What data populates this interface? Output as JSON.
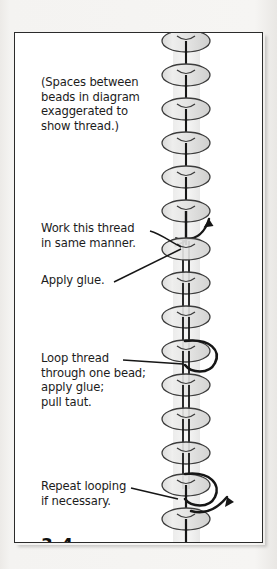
{
  "figure": {
    "number": "3–4",
    "frame_border_color": "#2b2b2b",
    "page_background": "#f3f2f0",
    "frame_background": "#ffffff"
  },
  "annotations": [
    {
      "id": "note",
      "name": "caption-spaces-note",
      "text": "(Spaces between\nbeads in diagram\nexaggerated to\nshow thread.)",
      "has_leader_line": false
    },
    {
      "id": "work",
      "name": "caption-work-thread",
      "text": "Work this thread\nin same manner.",
      "has_leader_line": true
    },
    {
      "id": "glue",
      "name": "caption-apply-glue",
      "text": "Apply glue.",
      "has_leader_line": true
    },
    {
      "id": "loop",
      "name": "caption-loop-thread",
      "text": "Loop thread\nthrough one bead;\napply glue;\npull taut.",
      "has_leader_line": true
    },
    {
      "id": "repeat",
      "name": "caption-repeat-looping",
      "text": "Repeat looping\nif necessary.",
      "has_leader_line": true
    }
  ],
  "diagram": {
    "type": "bead-strand-threading",
    "bead_count": 15,
    "bead_fill": "#e3e3e2",
    "bead_stroke": "#3c3c3c",
    "thread_color": "#161616",
    "column_center_x": 171,
    "bead_radius_x": 24,
    "bead_radius_y": 11,
    "bead_spacing_y": 34,
    "first_bead_y": 8,
    "arrows": [
      {
        "name": "arrow-upper-thread",
        "x": 192,
        "y": 196
      },
      {
        "name": "arrow-lower-thread",
        "x": 205,
        "y": 479
      }
    ],
    "loops": [
      {
        "name": "loop-upper-bead",
        "bead_index": 9
      },
      {
        "name": "loop-lower-bead",
        "bead_index": 13
      }
    ]
  }
}
